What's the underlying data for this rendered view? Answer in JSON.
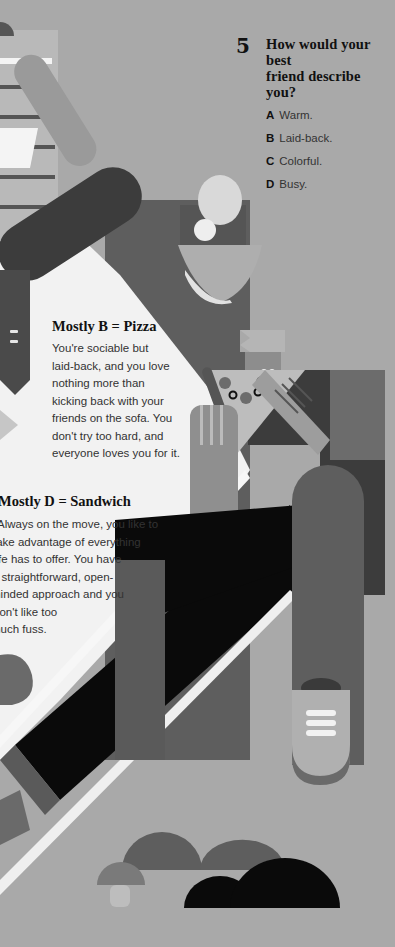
{
  "question": {
    "number": "5",
    "text_line1": "How would your best",
    "text_line2": "friend describe you?",
    "options": [
      {
        "letter": "A",
        "label": "Warm."
      },
      {
        "letter": "B",
        "label": "Laid-back."
      },
      {
        "letter": "C",
        "label": "Colorful."
      },
      {
        "letter": "D",
        "label": "Busy."
      }
    ]
  },
  "results": {
    "pizza": {
      "title": "Mostly B = Pizza",
      "lines": [
        "You're sociable but",
        "laid-back, and you love",
        "nothing more than",
        "kicking back with your",
        "friends on the sofa. You",
        "don't try too hard, and",
        "everyone loves you for it."
      ]
    },
    "sandwich": {
      "title": "Mostly D = Sandwich",
      "lines": [
        "Always on the move, you like to",
        "take advantage of everything",
        "life has to offer. You have",
        "a straightforward, open-",
        "minded approach and you",
        "don't like too",
        "much fuss."
      ]
    }
  },
  "colors": {
    "background": "#a9a9a9",
    "paper": "#f2f2f2",
    "dark": "#3c3c3c",
    "black": "#0a0a0a",
    "mid": "#6a6a6a"
  }
}
